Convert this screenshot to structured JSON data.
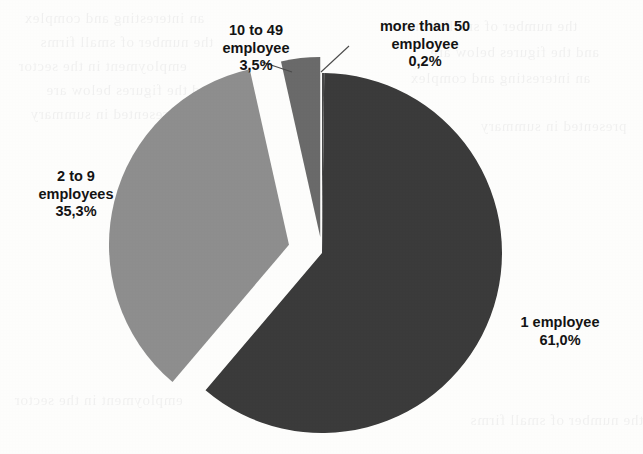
{
  "chart_data": {
    "type": "pie",
    "title": "",
    "subtitle": "",
    "xlabel": "",
    "ylabel": "",
    "legend_position": "none",
    "grid": false,
    "value_suffix": "%",
    "decimal_separator": ",",
    "categories": [
      "1 employee",
      "2 to 9 employees",
      "10 to 49 employee",
      "more than 50 employee"
    ],
    "values": [
      61.0,
      35.3,
      3.5,
      0.2
    ],
    "value_labels": [
      "61,0%",
      "35,3%",
      "3,5%",
      "0,2%"
    ],
    "colors": [
      "#3a3a3a",
      "#8e8e8e",
      "#6b6b6b",
      "#4a4a4a"
    ],
    "slices": [
      {
        "name": "1 employee",
        "label_line1": "1 employee",
        "label_line2": "61,0%",
        "value": 61.0,
        "value_label": "61,0%",
        "color": "#3a3a3a",
        "exploded": false,
        "start_angle_deg": 0.72,
        "end_angle_deg": 220.32
      },
      {
        "name": "2 to 9 employees",
        "label_line1": "2 to 9",
        "label_line2": "employees",
        "label_line3": "35,3%",
        "value": 35.3,
        "value_label": "35,3%",
        "color": "#8e8e8e",
        "exploded": true,
        "start_angle_deg": 220.32,
        "end_angle_deg": 347.4
      },
      {
        "name": "10 to 49 employee",
        "label_line1": "10 to 49",
        "label_line2": "employee",
        "label_line3": "3,5%",
        "value": 3.5,
        "value_label": "3,5%",
        "color": "#6b6b6b",
        "exploded": true,
        "start_angle_deg": 347.4,
        "end_angle_deg": 360.0
      },
      {
        "name": "more than 50 employee",
        "label_line1": "more than 50",
        "label_line2": "employee",
        "label_line3": "0,2%",
        "value": 0.2,
        "value_label": "0,2%",
        "color": "#4a4a4a",
        "exploded": false,
        "start_angle_deg": 0.0,
        "end_angle_deg": 0.72
      }
    ]
  },
  "labels": {
    "slice_1_employee": {
      "line1": "1 employee",
      "line2": "61,0%"
    },
    "slice_2_to_9": {
      "line1": "2 to 9",
      "line2": "employees",
      "line3": "35,3%"
    },
    "slice_10_to_49": {
      "line1": "10 to 49",
      "line2": "employee",
      "line3": "3,5%"
    },
    "slice_more_than_50": {
      "line1": "more than 50",
      "line2": "employee",
      "line3": "0,2%"
    }
  },
  "background": {
    "paper_color": "#fdfdfc",
    "ghost_text": [
      "an interesting and complex",
      "the number of small firms",
      "employment in the sector",
      "and the figures below are",
      "presented in summary"
    ]
  }
}
